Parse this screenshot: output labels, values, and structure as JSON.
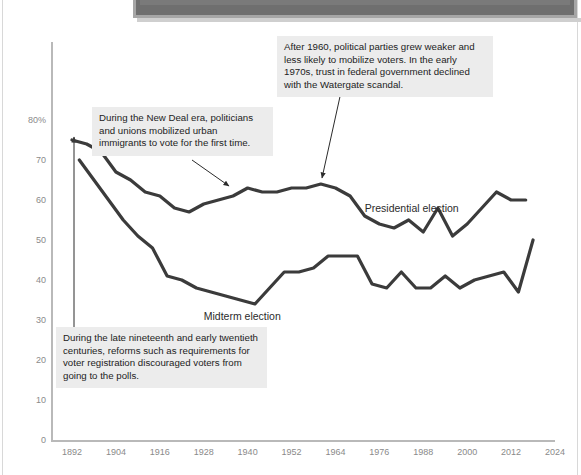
{
  "page": {
    "caption_fragment": ".org 2018g (accessed 11/8/18).",
    "background_color": "#ffffff"
  },
  "chart_data": {
    "type": "line",
    "title": "",
    "subtitle": "",
    "xlabel": "",
    "ylabel": "",
    "grid": false,
    "legend_position": "inline-labels",
    "xlim": [
      1890,
      2026
    ],
    "ylim": [
      0,
      84
    ],
    "x_tick_labels": [
      "1892",
      "1904",
      "1916",
      "1928",
      "1940",
      "1952",
      "1964",
      "1976",
      "1988",
      "2000",
      "2012",
      "2024"
    ],
    "x_tick_values": [
      1892,
      1904,
      1916,
      1928,
      1940,
      1952,
      1964,
      1976,
      1988,
      2000,
      2012,
      2024
    ],
    "y_tick_labels": [
      "0",
      "10",
      "20",
      "30",
      "40",
      "50",
      "60",
      "70",
      "80%"
    ],
    "y_tick_values": [
      0,
      10,
      20,
      30,
      40,
      50,
      60,
      70,
      80
    ],
    "y_unit": "%",
    "line_color": "#3b3b3b",
    "axis_color": "#b9b9b9",
    "tick_label_color": "#8a8a8a",
    "series": [
      {
        "name": "Presidential election",
        "label_x": 1972,
        "label_y": 58,
        "x": [
          1892,
          1896,
          1900,
          1904,
          1908,
          1912,
          1916,
          1920,
          1924,
          1928,
          1932,
          1936,
          1940,
          1944,
          1948,
          1952,
          1956,
          1960,
          1964,
          1968,
          1972,
          1976,
          1980,
          1984,
          1988,
          1992,
          1996,
          2000,
          2004,
          2008,
          2012,
          2016
        ],
        "values": [
          75,
          74,
          72,
          67,
          65,
          62,
          61,
          58,
          57,
          59,
          60,
          61,
          63,
          62,
          62,
          63,
          63,
          64,
          63,
          61,
          56,
          54,
          53,
          55,
          52,
          58,
          51,
          54,
          58,
          62,
          60,
          60
        ]
      },
      {
        "name": "Midterm election",
        "label_x": 1928,
        "label_y": 31,
        "x": [
          1894,
          1898,
          1902,
          1906,
          1910,
          1914,
          1918,
          1922,
          1926,
          1930,
          1934,
          1938,
          1942,
          1946,
          1950,
          1954,
          1958,
          1962,
          1966,
          1970,
          1974,
          1978,
          1982,
          1986,
          1990,
          1994,
          1998,
          2002,
          2006,
          2010,
          2014,
          2018
        ],
        "values": [
          70,
          65,
          60,
          55,
          51,
          48,
          41,
          40,
          38,
          37,
          36,
          35,
          34,
          38,
          42,
          42,
          43,
          46,
          46,
          46,
          39,
          38,
          42,
          38,
          38,
          41,
          38,
          40,
          41,
          42,
          37,
          50
        ]
      }
    ],
    "annotations": [
      {
        "id": "newdeal",
        "text": "During the New Deal era, politicians and unions mobilized urban immigrants to vote for the first time.",
        "points_to": "presidential-line-around-1940"
      },
      {
        "id": "postwar",
        "text": "After 1960, political parties grew weaker and less likely to mobilize voters. In the early 1970s, trust in federal government declined with the Watergate scandal.",
        "points_to": "presidential-line-around-1968"
      },
      {
        "id": "reforms",
        "text": "During the late nineteenth and early twentieth centuries, reforms such as requirements for voter registration discouraged voters from going to the polls.",
        "points_to": "presidential-line-around-1896"
      }
    ]
  }
}
